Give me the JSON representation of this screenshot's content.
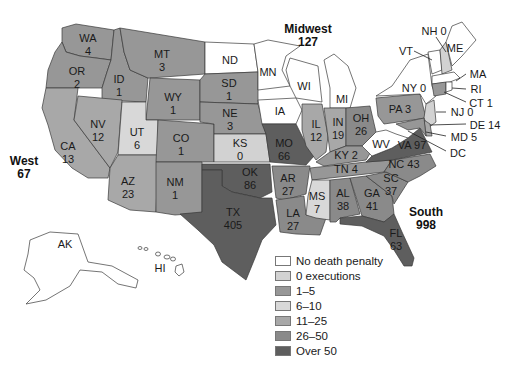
{
  "legend": {
    "items": [
      {
        "label": "No death penalty",
        "color": "#ffffff"
      },
      {
        "label": "0 executions",
        "color": "#d2d2d2"
      },
      {
        "label": "1–5",
        "color": "#979797"
      },
      {
        "label": "6–10",
        "color": "#d8d8d8"
      },
      {
        "label": "11–25",
        "color": "#a8a8a8"
      },
      {
        "label": "26–50",
        "color": "#8a8a8a"
      },
      {
        "label": "Over 50",
        "color": "#5e5e5e"
      }
    ]
  },
  "regions": {
    "west": {
      "name": "West",
      "total": "67"
    },
    "midwest": {
      "name": "Midwest",
      "total": "127"
    },
    "south": {
      "name": "South",
      "total": "998"
    }
  },
  "states": {
    "WA": {
      "abbr": "WA",
      "value": "4"
    },
    "OR": {
      "abbr": "OR",
      "value": "2"
    },
    "CA": {
      "abbr": "CA",
      "value": "13"
    },
    "ID": {
      "abbr": "ID",
      "value": "1"
    },
    "NV": {
      "abbr": "NV",
      "value": "12"
    },
    "MT": {
      "abbr": "MT",
      "value": "3"
    },
    "WY": {
      "abbr": "WY",
      "value": "1"
    },
    "UT": {
      "abbr": "UT",
      "value": "6"
    },
    "AZ": {
      "abbr": "AZ",
      "value": "23"
    },
    "CO": {
      "abbr": "CO",
      "value": "1"
    },
    "NM": {
      "abbr": "NM",
      "value": "1"
    },
    "ND": {
      "abbr": "ND",
      "value": ""
    },
    "SD": {
      "abbr": "SD",
      "value": "1"
    },
    "NE": {
      "abbr": "NE",
      "value": "3"
    },
    "KS": {
      "abbr": "KS",
      "value": "0"
    },
    "OK": {
      "abbr": "OK",
      "value": "86"
    },
    "TX": {
      "abbr": "TX",
      "value": "405"
    },
    "MN": {
      "abbr": "MN",
      "value": ""
    },
    "IA": {
      "abbr": "IA",
      "value": ""
    },
    "MO": {
      "abbr": "MO",
      "value": "66"
    },
    "AR": {
      "abbr": "AR",
      "value": "27"
    },
    "LA": {
      "abbr": "LA",
      "value": "27"
    },
    "WI": {
      "abbr": "WI",
      "value": ""
    },
    "MI": {
      "abbr": "MI",
      "value": ""
    },
    "IL": {
      "abbr": "IL",
      "value": "12"
    },
    "IN": {
      "abbr": "IN",
      "value": "19"
    },
    "OH": {
      "abbr": "OH",
      "value": "26"
    },
    "KY": {
      "abbr": "KY",
      "value": "2"
    },
    "TN": {
      "abbr": "TN",
      "value": "4"
    },
    "MS": {
      "abbr": "MS",
      "value": "7"
    },
    "AL": {
      "abbr": "AL",
      "value": "38"
    },
    "GA": {
      "abbr": "GA",
      "value": "41"
    },
    "FL": {
      "abbr": "FL",
      "value": "63"
    },
    "SC": {
      "abbr": "SC",
      "value": "37"
    },
    "NC": {
      "abbr": "NC",
      "value": "43"
    },
    "VA": {
      "abbr": "VA",
      "value": "97"
    },
    "WV": {
      "abbr": "WV",
      "value": ""
    },
    "PA": {
      "abbr": "PA",
      "value": "3"
    },
    "NY": {
      "abbr": "NY",
      "value": "0"
    },
    "VT": {
      "abbr": "VT",
      "value": ""
    },
    "NH": {
      "abbr": "NH",
      "value": "0"
    },
    "ME": {
      "abbr": "ME",
      "value": ""
    },
    "MA": {
      "abbr": "MA",
      "value": ""
    },
    "RI": {
      "abbr": "RI",
      "value": ""
    },
    "CT": {
      "abbr": "CT",
      "value": "1"
    },
    "NJ": {
      "abbr": "NJ",
      "value": "0"
    },
    "DE": {
      "abbr": "DE",
      "value": "14"
    },
    "MD": {
      "abbr": "MD",
      "value": "5"
    },
    "DC": {
      "abbr": "DC",
      "value": ""
    },
    "AK": {
      "abbr": "AK",
      "value": ""
    },
    "HI": {
      "abbr": "HI",
      "value": ""
    }
  },
  "callouts": {
    "NH": "NH 0",
    "VT": "VT",
    "MA": "MA",
    "RI": "RI",
    "CT": "CT 1",
    "NY": "NY 0",
    "NJ": "NJ 0",
    "DE": "DE 14",
    "MD": "MD 5",
    "DC": "DC",
    "PA": "PA 3",
    "KY": "KY 2",
    "TN": "TN 4",
    "NC": "NC 43",
    "VA": "VA 97"
  },
  "colors": {
    "none": "#ffffff",
    "zero": "#d2d2d2",
    "b1_5": "#979797",
    "b6_10": "#d8d8d8",
    "b11_25": "#a8a8a8",
    "b26_50": "#8a8a8a",
    "over50": "#5e5e5e"
  }
}
